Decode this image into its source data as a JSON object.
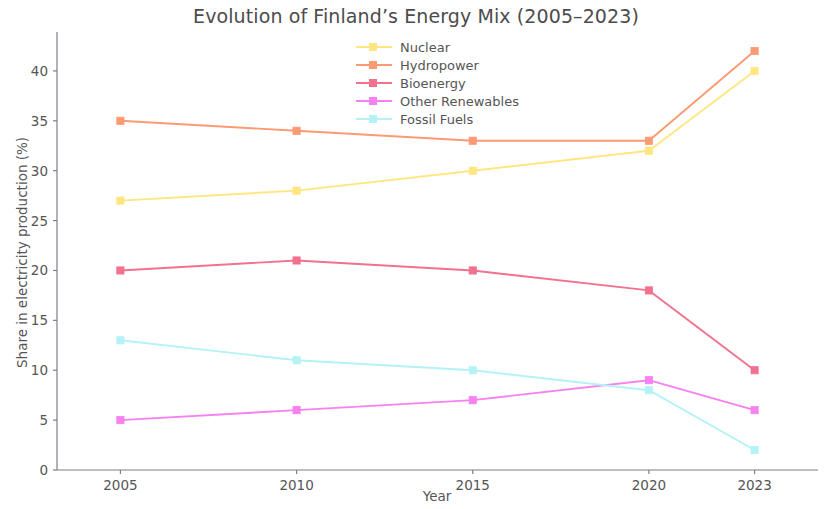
{
  "chart_data": {
    "type": "line",
    "title": "Evolution of Finland’s Energy Mix (2005–2023)",
    "xlabel": "Year",
    "ylabel": "Share in electricity production (%)",
    "categories": [
      "2005",
      "2010",
      "2015",
      "2020",
      "2023"
    ],
    "x": [
      2005,
      2010,
      2015,
      2020,
      2023
    ],
    "xlim": [
      2003.2,
      2024.8
    ],
    "ylim": [
      0,
      43.5
    ],
    "xticks": [
      "2005",
      "2010",
      "2015",
      "2020",
      "2023"
    ],
    "yticks": [
      "0",
      "5",
      "10",
      "15",
      "20",
      "25",
      "30",
      "35",
      "40"
    ],
    "ytick_values": [
      0,
      5,
      10,
      15,
      20,
      25,
      30,
      35,
      40
    ],
    "grid": false,
    "legend_position": "upper center",
    "spines": "left-bottom",
    "marker": "square",
    "series": [
      {
        "name": "Nuclear",
        "color": "#ffe680",
        "values": [
          27,
          28,
          30,
          32,
          40
        ]
      },
      {
        "name": "Hydropower",
        "color": "#fb9a73",
        "values": [
          35,
          34,
          33,
          33,
          42
        ]
      },
      {
        "name": "Bioenergy",
        "color": "#f2718f",
        "values": [
          20,
          21,
          20,
          18,
          10
        ]
      },
      {
        "name": "Other Renewables",
        "color": "#f781f0",
        "values": [
          5,
          6,
          7,
          9,
          6
        ]
      },
      {
        "name": "Fossil Fuels",
        "color": "#b5f2f5",
        "values": [
          13,
          11,
          10,
          8,
          2
        ]
      }
    ]
  },
  "legend": {
    "items": [
      {
        "label": "Nuclear"
      },
      {
        "label": "Hydropower"
      },
      {
        "label": "Bioenergy"
      },
      {
        "label": "Other Renewables"
      },
      {
        "label": "Fossil Fuels"
      }
    ]
  },
  "axis": {
    "color": "#7a7f8a",
    "tick_color": "#7a7f8a"
  }
}
